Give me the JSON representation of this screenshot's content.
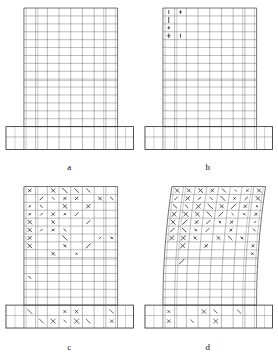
{
  "figure": {
    "type": "finite-element-crack-pattern",
    "background_color": "#ffffff",
    "mesh_color": "#555555",
    "crack_color": "#1a1a1a",
    "outline_color": "#333333",
    "panel_count": 4
  },
  "panels": [
    {
      "id": "a",
      "label": "a",
      "stage": "uncracked",
      "crack_density": 0.0,
      "crack_zone": "none",
      "drift_skew_px": 0,
      "mesh": {
        "columns": 8,
        "rows": 15
      }
    },
    {
      "id": "b",
      "label": "b",
      "stage": "initial-cracking",
      "crack_density": 0.18,
      "crack_zone": "lower-left-base",
      "drift_skew_px": 0,
      "mesh": {
        "columns": 8,
        "rows": 15
      }
    },
    {
      "id": "c",
      "label": "c",
      "stage": "distributed-cracking",
      "crack_density": 0.62,
      "crack_zone": "lower-half-and-footing",
      "drift_skew_px": 0,
      "mesh": {
        "columns": 8,
        "rows": 15
      }
    },
    {
      "id": "d",
      "label": "d",
      "stage": "ultimate-deformed",
      "crack_density": 0.78,
      "crack_zone": "full-height-with-lateral-drift",
      "drift_skew_px": 9,
      "mesh": {
        "columns": 8,
        "rows": 15
      }
    }
  ],
  "geometry": {
    "wall_left_px": 24,
    "wall_right_px": 118,
    "wall_top_px": 8,
    "wall_bottom_px": 127,
    "footing_left_px": 6,
    "footing_right_px": 134,
    "footing_top_px": 127,
    "footing_bottom_px": 150
  }
}
